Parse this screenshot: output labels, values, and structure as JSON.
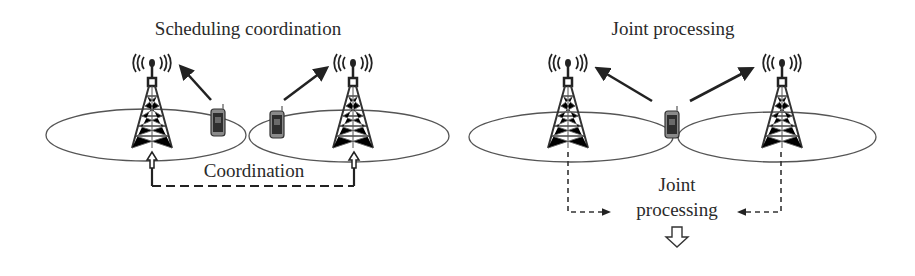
{
  "panels": [
    {
      "id": "scheduling",
      "title": "Scheduling coordination",
      "link_label": "Coordination",
      "towers": 2,
      "phones": 2
    },
    {
      "id": "joint",
      "title": "Joint processing",
      "center_label_line1": "Joint",
      "center_label_line2": "processing",
      "towers": 2,
      "phones": 1
    }
  ],
  "colors": {
    "ink": "#2a2a2a",
    "ellipse": "#555555",
    "background": "#ffffff"
  }
}
